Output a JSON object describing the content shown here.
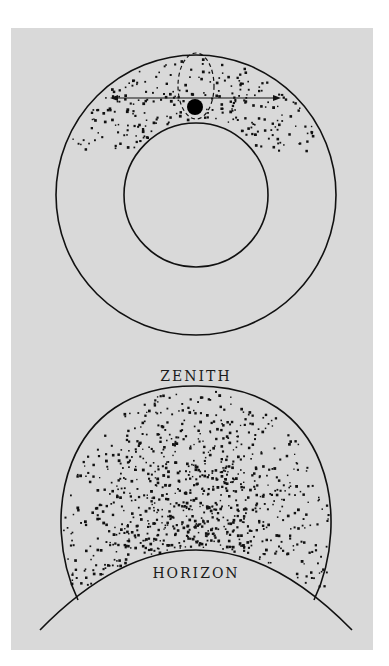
{
  "figure": {
    "top_diagram": {
      "description": "Cross-section of Earth with atmosphere shell; cosmic-ray particles concentrated in upper hemisphere; observer sphere with dashed ellipse and horizontal double arrow",
      "outer_circle": {
        "cx": 196,
        "cy": 195,
        "r": 140
      },
      "inner_circle": {
        "cx": 196,
        "cy": 195,
        "r": 72
      },
      "observer": {
        "cx": 195,
        "cy": 108,
        "r": 8
      },
      "arrow": {
        "x1": 110,
        "x2": 276,
        "y": 97
      }
    },
    "bottom_diagram": {
      "zenith_label": "ZENITH",
      "horizon_label": "HORIZON",
      "description": "Sky dome above horizon with particle density increasing toward the horizon center"
    },
    "colors": {
      "background": "#d9d9d9",
      "ink": "#111111",
      "page": "#ffffff"
    }
  }
}
